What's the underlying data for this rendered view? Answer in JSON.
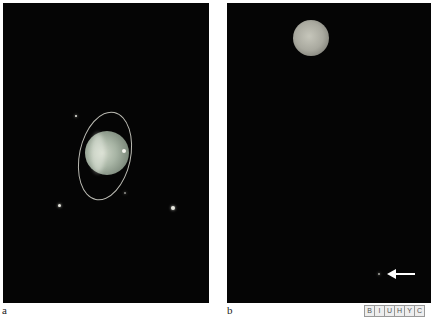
{
  "figure": {
    "panels": [
      {
        "label": "a",
        "content": "Ringed planet (Uranus) with ring system and moons, dark background",
        "colors": {
          "background": "#050505",
          "planet": "#a7b4a4",
          "ring": "#dcdcd2"
        }
      },
      {
        "label": "b",
        "content": "Planet disk at top with arrow pointing to faint object at lower right",
        "colors": {
          "background": "#050505",
          "planet": "#a9a99f",
          "arrow": "#ffffff"
        }
      }
    ],
    "badge_letters": [
      "B",
      "I",
      "U",
      "H",
      "Y",
      "C"
    ],
    "icons": {
      "arrow": "arrow-left-icon"
    }
  }
}
